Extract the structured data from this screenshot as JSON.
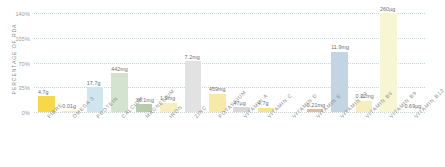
{
  "chart_data": {
    "type": "bar",
    "title": "",
    "xlabel": "",
    "ylabel": "PERCENTAGE OF RDA",
    "ylim": [
      0,
      140
    ],
    "grid": true,
    "legend": false,
    "ytick_labels": [
      "140%",
      "105%",
      "70%",
      "35%",
      "0%"
    ],
    "ytick_values": [
      140,
      105,
      70,
      35,
      0
    ],
    "categories": [
      "FIBRE",
      "OMEGA 3",
      "PROTEIN",
      "CALCIUM",
      "MAGNESIUM",
      "IRON",
      "ZINC",
      "POTASSIUM",
      "VITAMIN A",
      "VITAMIN C",
      "VITAMIN D",
      "VITAMIN E",
      "VITAMIN B3",
      "VITAMIN B6",
      "VITAMIN B9",
      "VITAMIN B12"
    ],
    "values": [
      22,
      2,
      35,
      55,
      11,
      13,
      72,
      26,
      7,
      6,
      0,
      4,
      85,
      16,
      140,
      2
    ],
    "data_labels": [
      "4.7g",
      "0.01g",
      "17.7g",
      "442mg",
      "36.1mg",
      "1.9mg",
      "7.2mg",
      "459mg",
      "47µg",
      "4.7g",
      "",
      "0.21mg",
      "11.9mg",
      "0.22mg",
      "260µg",
      "0.69µg"
    ],
    "colors": [
      "#f5d949",
      "#f7edb4",
      "#cfe6ef",
      "#d3e3cd",
      "#b6ccab",
      "#f6edc2",
      "#e2e2e2",
      "#f7e9a8",
      "#d8d8d8",
      "#f3e58d",
      "#ffffff",
      "#d9bfa8",
      "#c3d4e3",
      "#f7edc0",
      "#f7f6d2",
      "#ffffff"
    ],
    "accent_color": "#f5d949",
    "grid_color": "#c9d4de",
    "text_color": "#8b8b8b",
    "background": "#ffffff"
  }
}
